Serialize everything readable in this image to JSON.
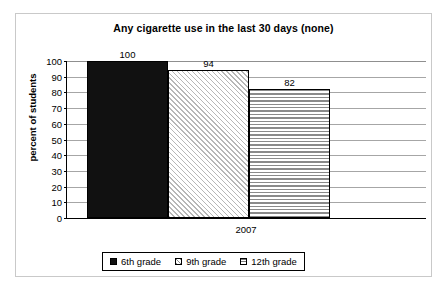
{
  "chart_data": {
    "type": "bar",
    "title": "Any cigarette use in the last 30 days (none)",
    "xlabel": "",
    "ylabel": "percent of students",
    "categories": [
      "2007"
    ],
    "series": [
      {
        "name": "6th grade",
        "values": [
          100
        ],
        "pattern": "solid-black"
      },
      {
        "name": "9th grade",
        "values": [
          94
        ],
        "pattern": "diagonal-hatch"
      },
      {
        "name": "12th grade",
        "values": [
          82
        ],
        "pattern": "horizontal-lines"
      }
    ],
    "data_labels": [
      "100",
      "94",
      "82"
    ],
    "ylim": [
      0,
      100
    ],
    "ytick_labels": [
      "100",
      "90",
      "80",
      "70",
      "60",
      "50",
      "40",
      "30",
      "20",
      "10",
      "0"
    ],
    "ytick_values": [
      100,
      90,
      80,
      70,
      60,
      50,
      40,
      30,
      20,
      10,
      0
    ],
    "grid": true,
    "legend_position": "bottom",
    "colors": {
      "gridline": "#a6a6a6",
      "axis": "#000000",
      "frame": "#c9c9c9",
      "bar_1": "#111111",
      "bar_2": "#b7b7b7",
      "bar_3": "#8a8a8a",
      "background": "#ffffff",
      "text": "#000000"
    }
  }
}
